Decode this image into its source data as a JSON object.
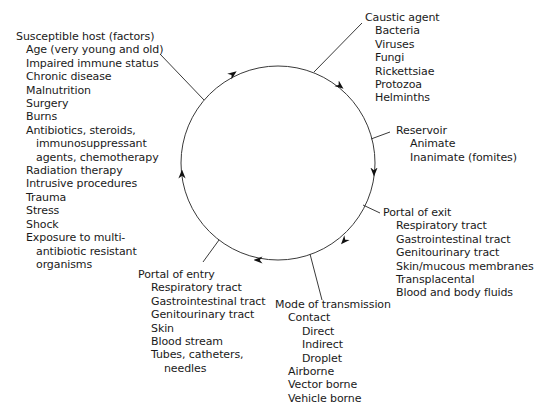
{
  "diagram": {
    "type": "cycle",
    "circle": {
      "cx": 278,
      "cy": 163,
      "r": 97,
      "stroke": "#3a3a3a"
    },
    "nodes": {
      "caustic_agent": {
        "label": "Caustic agent",
        "items": [
          "Bacteria",
          "Viruses",
          "Fungi",
          "Rickettsiae",
          "Protozoa",
          "Helminths"
        ]
      },
      "reservoir": {
        "label": "Reservoir",
        "items": [
          "Animate",
          "Inanimate (fomites)"
        ]
      },
      "portal_of_exit": {
        "label": "Portal of exit",
        "items": [
          "Respiratory tract",
          "Gastrointestinal tract",
          "Genitourinary tract",
          "Skin/mucous membranes",
          "Transplacental",
          "Blood and body fluids"
        ]
      },
      "mode_of_transmission": {
        "label": "Mode of transmission",
        "contact": "Contact",
        "contact_items": [
          "Direct",
          "Indirect",
          "Droplet"
        ],
        "items": [
          "Airborne",
          "Vector borne",
          "Vehicle borne"
        ]
      },
      "portal_of_entry": {
        "label": "Portal of entry",
        "items": [
          "Respiratory tract",
          "Gastrointestinal tract",
          "Genitourinary tract",
          "Skin",
          "Blood stream",
          "Tubes, catheters,"
        ],
        "continuation": "needles"
      },
      "susceptible_host": {
        "label": "Susceptible host (factors)",
        "items_a": [
          "Age (very young and old)",
          "Impaired immune status",
          "Chronic disease",
          "Malnutrition",
          "Surgery",
          "Burns",
          "Antibiotics, steroids,"
        ],
        "cont_a": [
          "immunosuppressant",
          "agents, chemotherapy"
        ],
        "items_b": [
          "Radiation therapy",
          "Intrusive procedures",
          "Trauma",
          "Stress",
          "Shock",
          "Exposure to multi-"
        ],
        "cont_b": [
          "antibiotic resistant",
          "organisms"
        ]
      }
    },
    "flow_direction": "clockwise",
    "arrow_icon": "arrowhead-icon"
  }
}
